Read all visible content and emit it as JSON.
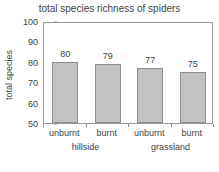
{
  "chart_data": {
    "type": "bar",
    "title": "total species richness of spiders",
    "xlabel": "",
    "ylabel": "total species",
    "categories": [
      "unburnt",
      "burnt",
      "unburnt",
      "burnt"
    ],
    "values": [
      80,
      79,
      77,
      75
    ],
    "data_labels": [
      "80",
      "79",
      "77",
      "75"
    ],
    "groups": [
      {
        "label": "hillside",
        "categories": [
          "unburnt",
          "burnt"
        ]
      },
      {
        "label": "grassland",
        "categories": [
          "unburnt",
          "burnt"
        ]
      }
    ],
    "group_labels": [
      "hillside",
      "grassland"
    ],
    "ylim": [
      50,
      100
    ],
    "ytick_values": [
      100,
      90,
      80,
      70,
      60,
      50
    ],
    "ytick_labels": [
      "100",
      "90",
      "80",
      "70",
      "60",
      "50"
    ],
    "ytick_step": 10,
    "grid": false,
    "legend": false,
    "legend_position": "none",
    "bar_fill_color": "#c2c2c2",
    "bar_border_color": "#8e8e8e",
    "axis_color": "#9a9a9a",
    "text_color": "#3f3f3f",
    "background_color": "#ffffff"
  }
}
